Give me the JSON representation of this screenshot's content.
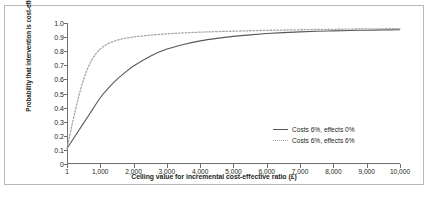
{
  "chart_data": {
    "type": "line",
    "title": "",
    "xlabel": "Ceiling value for incremental cost-effective ratio (£)",
    "ylabel": "Probability that intervention is cost-effective",
    "xlim": [
      1,
      10000
    ],
    "ylim": [
      0,
      1.0
    ],
    "grid": false,
    "legend_position": "inside-bottom-right",
    "xticks": [
      {
        "value": 1,
        "label": "1"
      },
      {
        "value": 1000,
        "label": "1,000"
      },
      {
        "value": 2000,
        "label": "2,000"
      },
      {
        "value": 3000,
        "label": "3,000"
      },
      {
        "value": 4000,
        "label": "4,000"
      },
      {
        "value": 5000,
        "label": "5,000"
      },
      {
        "value": 6000,
        "label": "6,000"
      },
      {
        "value": 7000,
        "label": "7,000"
      },
      {
        "value": 8000,
        "label": "8,000"
      },
      {
        "value": 9000,
        "label": "9,000"
      },
      {
        "value": 10000,
        "label": "10,000"
      }
    ],
    "yticks": [
      {
        "value": 0,
        "label": "0"
      },
      {
        "value": 0.1,
        "label": "0.1"
      },
      {
        "value": 0.2,
        "label": "0.2"
      },
      {
        "value": 0.3,
        "label": "0.3"
      },
      {
        "value": 0.4,
        "label": "0.4"
      },
      {
        "value": 0.5,
        "label": "0.5"
      },
      {
        "value": 0.6,
        "label": "0.6"
      },
      {
        "value": 0.7,
        "label": "0.7"
      },
      {
        "value": 0.8,
        "label": "0.8"
      },
      {
        "value": 0.9,
        "label": "0.9"
      },
      {
        "value": 1.0,
        "label": "1.0"
      }
    ],
    "x": [
      1,
      250,
      500,
      750,
      1000,
      1250,
      1500,
      1750,
      2000,
      2500,
      3000,
      3500,
      4000,
      4500,
      5000,
      5500,
      6000,
      6500,
      7000,
      7500,
      8000,
      8500,
      9000,
      9500,
      10000
    ],
    "series": [
      {
        "name": "Costs 6%, effects 0%",
        "style": "solid",
        "color": "#58585b",
        "values": [
          0.11,
          0.2,
          0.29,
          0.38,
          0.47,
          0.54,
          0.6,
          0.65,
          0.695,
          0.765,
          0.815,
          0.848,
          0.873,
          0.891,
          0.905,
          0.916,
          0.925,
          0.932,
          0.937,
          0.941,
          0.944,
          0.947,
          0.949,
          0.951,
          0.952
        ]
      },
      {
        "name": "Costs 6%, effects 6%",
        "style": "dotted",
        "color": "#a8a8ad",
        "values": [
          0.11,
          0.38,
          0.6,
          0.74,
          0.815,
          0.855,
          0.878,
          0.892,
          0.901,
          0.914,
          0.923,
          0.93,
          0.935,
          0.939,
          0.942,
          0.945,
          0.948,
          0.95,
          0.952,
          0.954,
          0.955,
          0.957,
          0.958,
          0.959,
          0.96
        ]
      }
    ]
  },
  "legend": {
    "items": [
      {
        "label": "Costs 6%, effects 0%"
      },
      {
        "label": "Costs 6%, effects 6%"
      }
    ]
  },
  "caption": {
    "text": ""
  }
}
